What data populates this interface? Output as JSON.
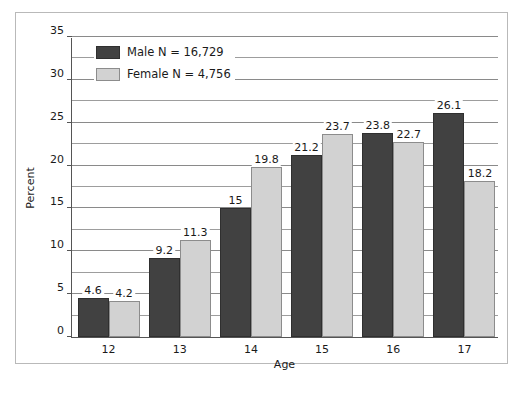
{
  "chart_data": {
    "type": "bar",
    "title": "",
    "xlabel": "Age",
    "ylabel": "Percent",
    "categories": [
      "12",
      "13",
      "14",
      "15",
      "16",
      "17"
    ],
    "series": [
      {
        "name": "Male",
        "legend_label": "Male N = 16,729",
        "color": "#414141",
        "values": [
          4.6,
          9.2,
          15,
          21.2,
          23.8,
          26.1
        ],
        "value_labels": [
          "4.6",
          "9.2",
          "15",
          "21.2",
          "23.8",
          "26.1"
        ]
      },
      {
        "name": "Female",
        "legend_label": "Female N = 4,756",
        "color": "#d2d2d2",
        "values": [
          4.2,
          11.3,
          19.8,
          23.7,
          22.7,
          18.2
        ],
        "value_labels": [
          "4.2",
          "11.3",
          "19.8",
          "23.7",
          "22.7",
          "18.2"
        ]
      }
    ],
    "ylim": [
      0,
      35
    ],
    "yticks": [
      0,
      5,
      10,
      15,
      20,
      25,
      30,
      35
    ],
    "ytick_labels": [
      "0",
      "5",
      "10",
      "15",
      "20",
      "25",
      "30",
      "35"
    ],
    "y_minor_step": 2.5,
    "grid": true,
    "legend_position": "top-left"
  }
}
